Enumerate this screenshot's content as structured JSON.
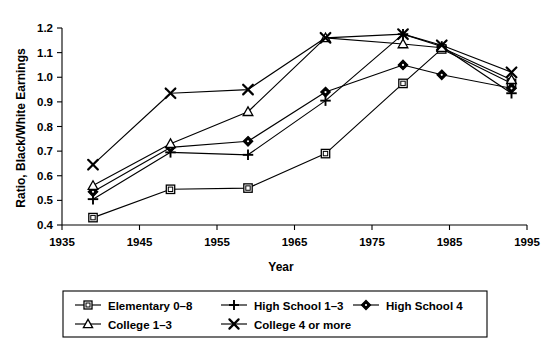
{
  "chart_data": {
    "type": "line",
    "title": "",
    "xlabel": "Year",
    "ylabel": "Ratio, Black/White Earnings",
    "x": [
      1939,
      1949,
      1959,
      1969,
      1979,
      1984,
      1993
    ],
    "xlim": [
      1935,
      1995
    ],
    "ylim": [
      0.4,
      1.2
    ],
    "xticks": [
      1935,
      1945,
      1955,
      1965,
      1975,
      1985,
      1995
    ],
    "xticklabels": [
      "1935",
      "1945",
      "1955",
      "1965",
      "1975",
      "1985",
      "1995"
    ],
    "yticks": [
      0.4,
      0.5,
      0.6,
      0.7,
      0.8,
      0.9,
      1.0,
      1.1,
      1.2
    ],
    "yticklabels": [
      "0.4",
      "0.5",
      "0.6",
      "0.7",
      "0.8",
      "0.9",
      "1.0",
      "1.1",
      "1.2"
    ],
    "grid": false,
    "legend_position": "bottom",
    "series": [
      {
        "name": "Elementary 0–8",
        "marker": "square-open",
        "values": [
          0.43,
          0.545,
          0.55,
          0.69,
          0.975,
          1.115,
          0.975
        ]
      },
      {
        "name": "High School 1–3",
        "marker": "plus",
        "values": [
          0.505,
          0.695,
          0.685,
          0.905,
          1.175,
          1.125,
          0.935
        ]
      },
      {
        "name": "High School 4",
        "marker": "diamond-solid",
        "values": [
          0.535,
          0.715,
          0.74,
          0.94,
          1.05,
          1.01,
          0.955
        ]
      },
      {
        "name": "College 1–3",
        "marker": "triangle-open",
        "values": [
          0.56,
          0.73,
          0.86,
          1.16,
          1.135,
          1.12,
          0.99
        ]
      },
      {
        "name": "College 4 or more",
        "marker": "cross",
        "values": [
          0.645,
          0.935,
          0.95,
          1.16,
          1.175,
          1.13,
          1.02
        ]
      }
    ]
  },
  "legend": {
    "items": [
      {
        "label": "Elementary 0–8",
        "marker": "square-open"
      },
      {
        "label": "High School 1–3",
        "marker": "plus"
      },
      {
        "label": "High School 4",
        "marker": "diamond-solid"
      },
      {
        "label": "College 1–3",
        "marker": "triangle-open"
      },
      {
        "label": "College 4 or more",
        "marker": "cross"
      }
    ]
  },
  "colors": {
    "ink": "#000000",
    "paper": "#ffffff"
  }
}
